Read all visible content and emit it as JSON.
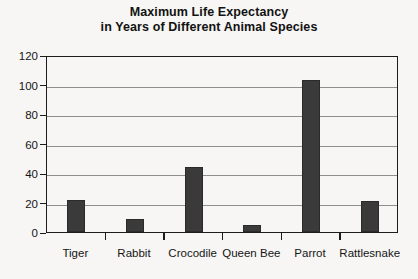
{
  "chart_data": {
    "type": "bar",
    "title": "Maximum Life Expectancy in Years of Different Animal Species",
    "title_lines": [
      "Maximum Life Expectancy",
      "in Years of Different Animal Species"
    ],
    "categories": [
      "Tiger",
      "Rabbit",
      "Crocodile",
      "Queen Bee",
      "Parrot",
      "Rattlesnake"
    ],
    "values": [
      22,
      9,
      44,
      5,
      103,
      21
    ],
    "xlabel": "",
    "ylabel": "",
    "ylim": [
      0,
      120
    ],
    "ytick_step": 20,
    "yticks": [
      120,
      100,
      80,
      60,
      40,
      20,
      0
    ],
    "ytick_labels": [
      "120",
      "100",
      "80",
      "60",
      "40",
      "20",
      "0"
    ],
    "grid": "horizontal",
    "legend": "none",
    "bar_color": "#3a3a3a",
    "gridline_color": "#8e8e8e",
    "axis_color": "#1c1c1c",
    "background_color": "#f7f6f4"
  }
}
